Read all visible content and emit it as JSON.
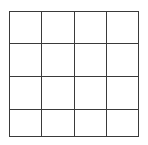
{
  "grid": {
    "rows": 4,
    "cols": 4,
    "x_lines": [
      9,
      41,
      74,
      106,
      138
    ],
    "y_lines": [
      11,
      43,
      76,
      109,
      136
    ],
    "line_color": "#3a3a3a",
    "background": "#ffffff"
  }
}
